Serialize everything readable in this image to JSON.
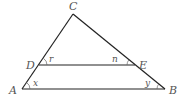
{
  "diagram": {
    "type": "triangle-with-parallel-segment",
    "vertices": {
      "A": {
        "label": "A",
        "x": 22,
        "y": 89
      },
      "B": {
        "label": "B",
        "x": 165,
        "y": 89
      },
      "C": {
        "label": "C",
        "x": 73,
        "y": 14
      },
      "D": {
        "label": "D",
        "x": 39,
        "y": 65
      },
      "E": {
        "label": "E",
        "x": 135,
        "y": 65
      }
    },
    "segments": [
      "AB",
      "AC",
      "BC",
      "DE"
    ],
    "angles": {
      "x": {
        "label": "x",
        "vertex": "A"
      },
      "y": {
        "label": "y",
        "vertex": "B"
      },
      "r": {
        "label": "r",
        "vertex": "D"
      },
      "n": {
        "label": "n",
        "vertex": "E"
      }
    },
    "colors": {
      "line": "#222222",
      "label": "#555555"
    }
  }
}
